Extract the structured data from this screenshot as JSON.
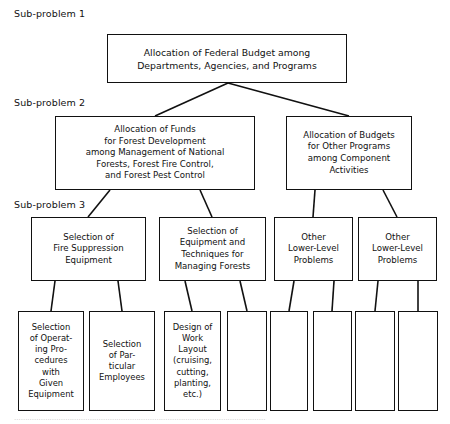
{
  "diagram": {
    "background_color": "#ffffff",
    "line_color": "#111111",
    "text_color": "#111111",
    "level_labels": [
      {
        "id": "sub-problem-1",
        "text": "Sub-problem 1",
        "x": 14,
        "y": 8
      },
      {
        "id": "sub-problem-2",
        "text": "Sub-problem 2",
        "x": 14,
        "y": 97
      },
      {
        "id": "sub-problem-3",
        "text": "Sub-problem 3",
        "x": 14,
        "y": 199
      }
    ],
    "nodes": [
      {
        "id": "federal-budget-allocation",
        "level": 1,
        "text": "Allocation of Federal Budget among\nDepartments, Agencies, and Programs",
        "x": 107,
        "y": 34,
        "w": 240,
        "h": 49
      },
      {
        "id": "forest-development-funds",
        "level": 2,
        "text": "Allocation of Funds\nfor Forest Development\namong Management of National\nForests, Forest Fire Control,\nand Forest Pest Control",
        "x": 55,
        "y": 116,
        "w": 200,
        "h": 74
      },
      {
        "id": "other-programs-budgets",
        "level": 2,
        "text": "Allocation of Budgets\nfor Other Programs\namong Component\nActivities",
        "x": 286,
        "y": 116,
        "w": 126,
        "h": 74
      },
      {
        "id": "fire-suppression-equipment",
        "level": 3,
        "text": "Selection of\nFire Suppression\nEquipment",
        "x": 31,
        "y": 217,
        "w": 115,
        "h": 64
      },
      {
        "id": "equipment-techniques-forests",
        "level": 3,
        "text": "Selection of\nEquipment and\nTechniques for\nManaging Forests",
        "x": 159,
        "y": 217,
        "w": 107,
        "h": 64
      },
      {
        "id": "other-lower-level-problems-1",
        "level": 3,
        "text": "Other\nLower-Level\nProblems",
        "x": 274,
        "y": 217,
        "w": 79,
        "h": 64
      },
      {
        "id": "other-lower-level-problems-2",
        "level": 3,
        "text": "Other\nLower-Level\nProblems",
        "x": 358,
        "y": 217,
        "w": 79,
        "h": 64
      },
      {
        "id": "operating-procedures-given-equipment",
        "level": 4,
        "text": "Selection\nof Operat-\ning Pro-\ncedures\nwith\nGiven\nEquipment",
        "x": 18,
        "y": 311,
        "w": 66,
        "h": 100
      },
      {
        "id": "particular-employees",
        "level": 4,
        "text": "Selection\nof Par-\nticular\nEmployees",
        "x": 89,
        "y": 311,
        "w": 66,
        "h": 100
      },
      {
        "id": "work-layout-design",
        "level": 4,
        "text": "Design of\nWork\nLayout\n(cruising,\ncutting,\nplanting,\netc.)",
        "x": 164,
        "y": 311,
        "w": 57,
        "h": 100
      },
      {
        "id": "blank-node-1",
        "level": 4,
        "text": "",
        "x": 227,
        "y": 311,
        "w": 40,
        "h": 100
      },
      {
        "id": "blank-node-2",
        "level": 4,
        "text": "",
        "x": 270,
        "y": 311,
        "w": 38,
        "h": 100
      },
      {
        "id": "blank-node-3",
        "level": 4,
        "text": "",
        "x": 313,
        "y": 311,
        "w": 39,
        "h": 100
      },
      {
        "id": "blank-node-4",
        "level": 4,
        "text": "",
        "x": 355,
        "y": 311,
        "w": 40,
        "h": 100
      },
      {
        "id": "blank-node-5",
        "level": 4,
        "text": "",
        "x": 398,
        "y": 311,
        "w": 40,
        "h": 100
      }
    ],
    "connectors": [
      {
        "id": "c-root-to-forest",
        "x1": 228,
        "y1": 83,
        "x2": 155,
        "y2": 116
      },
      {
        "id": "c-root-to-other",
        "x1": 228,
        "y1": 83,
        "x2": 349,
        "y2": 116
      },
      {
        "id": "c-forest-to-fire",
        "x1": 110,
        "y1": 190,
        "x2": 88,
        "y2": 217
      },
      {
        "id": "c-forest-to-equip",
        "x1": 200,
        "y1": 190,
        "x2": 212,
        "y2": 217
      },
      {
        "id": "c-other-to-lower1",
        "x1": 315,
        "y1": 190,
        "x2": 313,
        "y2": 217
      },
      {
        "id": "c-other-to-lower2",
        "x1": 383,
        "y1": 190,
        "x2": 397,
        "y2": 217
      },
      {
        "id": "c-fire-to-proc",
        "x1": 55,
        "y1": 281,
        "x2": 51,
        "y2": 311
      },
      {
        "id": "c-fire-to-emp",
        "x1": 118,
        "y1": 281,
        "x2": 122,
        "y2": 311
      },
      {
        "id": "c-equip-to-layout",
        "x1": 185,
        "y1": 281,
        "x2": 192,
        "y2": 311
      },
      {
        "id": "c-equip-to-blank1",
        "x1": 240,
        "y1": 281,
        "x2": 247,
        "y2": 311
      },
      {
        "id": "c-lower1-to-blank2",
        "x1": 294,
        "y1": 281,
        "x2": 289,
        "y2": 311
      },
      {
        "id": "c-lower1-to-blank3",
        "x1": 334,
        "y1": 281,
        "x2": 332,
        "y2": 311
      },
      {
        "id": "c-lower2-to-blank4",
        "x1": 378,
        "y1": 281,
        "x2": 375,
        "y2": 311
      },
      {
        "id": "c-lower2-to-blank5",
        "x1": 418,
        "y1": 281,
        "x2": 418,
        "y2": 311
      }
    ],
    "footnote": "................................................................................................................."
  }
}
